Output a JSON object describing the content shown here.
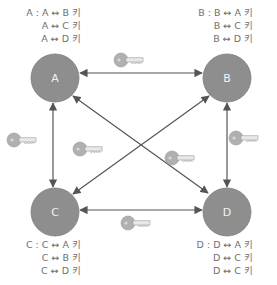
{
  "colors": {
    "node_fill": "#8e8e8e",
    "node_stroke": "#7a7a7a",
    "edge": "#555555",
    "key_fill": "#b0b0b0",
    "text": "#707070"
  },
  "nodes": [
    {
      "id": "A",
      "label": "A",
      "cx": 55,
      "cy": 78,
      "r": 24
    },
    {
      "id": "B",
      "label": "B",
      "cx": 227,
      "cy": 78,
      "r": 24
    },
    {
      "id": "C",
      "label": "C",
      "cx": 55,
      "cy": 212,
      "r": 24
    },
    {
      "id": "D",
      "label": "D",
      "cx": 227,
      "cy": 212,
      "r": 24
    }
  ],
  "key_lists": {
    "A": {
      "prefix": "A :",
      "lines": [
        "A ↔ B 키",
        "A ↔ C 키",
        "A ↔ D 키"
      ]
    },
    "B": {
      "prefix": "B :",
      "lines": [
        "B ↔ A 키",
        "B ↔ C 키",
        "B ↔ D 키"
      ]
    },
    "C": {
      "prefix": "C :",
      "lines": [
        "C ↔ A 키",
        "C ↔ B 키",
        "C ↔ D 키"
      ]
    },
    "D": {
      "prefix": "D :",
      "lines": [
        "D ↔ A 키",
        "D ↔ C 키",
        "D ↔ C 키"
      ]
    }
  },
  "edges": [
    {
      "from": "A",
      "to": "B",
      "bidirectional": true
    },
    {
      "from": "A",
      "to": "C",
      "bidirectional": true
    },
    {
      "from": "B",
      "to": "D",
      "bidirectional": true
    },
    {
      "from": "C",
      "to": "D",
      "bidirectional": true
    },
    {
      "from": "A",
      "to": "D",
      "bidirectional": true
    },
    {
      "from": "B",
      "to": "C",
      "bidirectional": true
    }
  ],
  "key_icons": [
    {
      "edge": "A-B",
      "x": 128,
      "y": 62
    },
    {
      "edge": "A-C",
      "x": 18,
      "y": 140
    },
    {
      "edge": "B-C",
      "x": 88,
      "y": 150
    },
    {
      "edge": "A-D",
      "x": 182,
      "y": 160
    },
    {
      "edge": "B-D",
      "x": 238,
      "y": 140
    },
    {
      "edge": "C-D",
      "x": 133,
      "y": 222
    }
  ]
}
